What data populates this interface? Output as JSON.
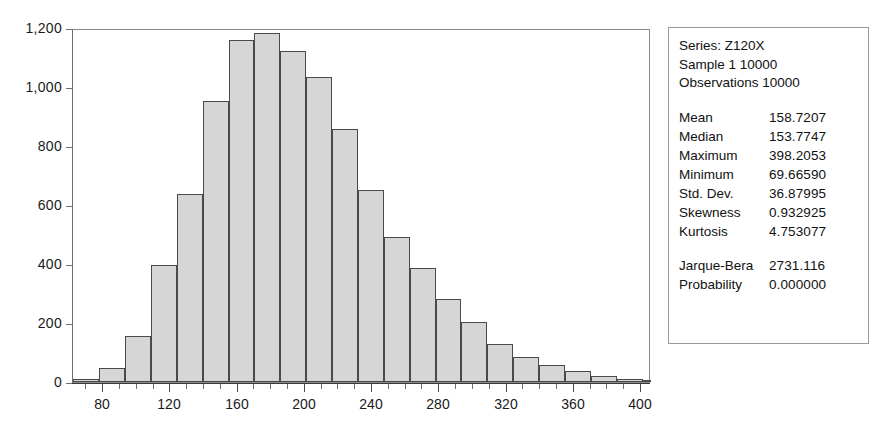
{
  "chart_data": {
    "type": "bar",
    "title": "",
    "xlabel": "",
    "ylabel": "",
    "grid": false,
    "legend_position": "none",
    "xlim": [
      62,
      406
    ],
    "ylim": [
      0,
      1200
    ],
    "x_ticks": [
      80,
      120,
      160,
      200,
      240,
      280,
      320,
      360,
      400
    ],
    "x_tick_labels": [
      "80",
      "120",
      "160",
      "200",
      "240",
      "280",
      "320",
      "360",
      "400"
    ],
    "x_minor_tick_step": 10,
    "y_ticks": [
      0,
      200,
      400,
      600,
      800,
      1000,
      1200
    ],
    "y_tick_labels": [
      "0",
      "200",
      "400",
      "600",
      "800",
      "1,000",
      "1,200"
    ],
    "bin_width": 15.4,
    "bin_starts": [
      62.2,
      77.6,
      93.0,
      108.4,
      123.8,
      139.2,
      154.6,
      170.0,
      185.4,
      200.8,
      216.2,
      231.6,
      247.0,
      262.4,
      277.8,
      293.2,
      308.6,
      324.0,
      339.4,
      354.8,
      370.2,
      385.6
    ],
    "categories": [
      "62-78",
      "78-93",
      "93-108",
      "108-124",
      "124-139",
      "139-155",
      "155-170",
      "170-185",
      "185-201",
      "201-216",
      "216-232",
      "232-247",
      "247-262",
      "262-278",
      "278-293",
      "293-309",
      "309-324",
      "324-339",
      "339-355",
      "355-370",
      "370-386",
      "386-401"
    ],
    "values": [
      10,
      48,
      155,
      395,
      638,
      952,
      1160,
      1182,
      1122,
      1035,
      858,
      650,
      490,
      385,
      283,
      203,
      128,
      85,
      57,
      36,
      20,
      11
    ],
    "tail_values": [
      9,
      6,
      4,
      14,
      5,
      3,
      2,
      2,
      2,
      5
    ],
    "tail_starts": [
      293.2,
      308.6,
      324.0,
      339.4,
      354.8,
      370.2,
      385.6,
      401.0,
      416.4,
      431.8
    ],
    "bars": [
      {
        "start": 62.2,
        "value": 10
      },
      {
        "start": 77.6,
        "value": 48
      },
      {
        "start": 93.0,
        "value": 155
      },
      {
        "start": 108.4,
        "value": 395
      },
      {
        "start": 123.8,
        "value": 638
      },
      {
        "start": 139.2,
        "value": 952
      },
      {
        "start": 154.6,
        "value": 1160
      },
      {
        "start": 170.0,
        "value": 1182
      },
      {
        "start": 185.4,
        "value": 1122
      },
      {
        "start": 200.8,
        "value": 1035
      },
      {
        "start": 216.2,
        "value": 858
      },
      {
        "start": 231.6,
        "value": 650
      },
      {
        "start": 247.0,
        "value": 490
      },
      {
        "start": 262.4,
        "value": 385
      },
      {
        "start": 277.8,
        "value": 283
      },
      {
        "start": 293.2,
        "value": 203
      },
      {
        "start": 308.6,
        "value": 128
      },
      {
        "start": 324.0,
        "value": 85
      },
      {
        "start": 339.4,
        "value": 57
      },
      {
        "start": 354.8,
        "value": 36
      },
      {
        "start": 370.2,
        "value": 20
      },
      {
        "start": 385.6,
        "value": 11
      }
    ],
    "colors": {
      "bar_fill": "#d6d6d6",
      "bar_border": "#4a4a4a",
      "axis": "#6b6b6b",
      "frame": "#8a8a8a",
      "text": "#111111"
    }
  },
  "stats": {
    "header": [
      "Series: Z120X",
      "Sample 1 10000",
      "Observations 10000"
    ],
    "rows": [
      {
        "key": "Mean",
        "value": "158.7207"
      },
      {
        "key": "Median",
        "value": "153.7747"
      },
      {
        "key": "Maximum",
        "value": "398.2053"
      },
      {
        "key": "Minimum",
        "value": "69.66590"
      },
      {
        "key": "Std. Dev.",
        "value": "36.87995"
      },
      {
        "key": "Skewness",
        "value": "0.932925"
      },
      {
        "key": "Kurtosis",
        "value": "4.753077"
      }
    ],
    "test_rows": [
      {
        "key": "Jarque-Bera",
        "value": "2731.116"
      },
      {
        "key": "Probability",
        "value": "0.000000"
      }
    ]
  }
}
